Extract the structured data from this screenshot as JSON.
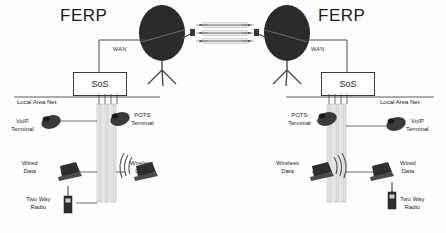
{
  "diagram": {
    "left_site": {
      "site_label": "FERP",
      "node_label": "SoS",
      "wan_label": "WAN",
      "lan_label": "Local Area Net",
      "devices": [
        {
          "name": "VoIP Terminal",
          "line1": "VoIP",
          "line2": "Terminal",
          "icon": "desk-phone-icon"
        },
        {
          "name": "POTS Terminal",
          "line1": "POTS",
          "line2": "Terminal",
          "icon": "desk-phone-icon"
        },
        {
          "name": "Wired Data",
          "line1": "Wired",
          "line2": "Data",
          "icon": "laptop-icon"
        },
        {
          "name": "Wireless Data",
          "line1": "Wireless",
          "line2": "Data",
          "icon": "laptop-wireless-icon"
        },
        {
          "name": "Two Way Radio",
          "line1": "Two Way",
          "line2": "Radio",
          "icon": "handheld-radio-icon"
        }
      ]
    },
    "right_site": {
      "site_label": "FERP",
      "node_label": "SoS",
      "wan_label": "WAN",
      "lan_label": "Local Area Net",
      "devices": [
        {
          "name": "POTS Terminal",
          "line1": "POTS",
          "line2": "Terminal",
          "icon": "desk-phone-icon"
        },
        {
          "name": "VoIP Terminal",
          "line1": "VoIP",
          "line2": "Terminal",
          "icon": "desk-phone-icon"
        },
        {
          "name": "Wireless Data",
          "line1": "Wireless",
          "line2": "Data",
          "icon": "laptop-wireless-icon"
        },
        {
          "name": "Wired Data",
          "line1": "Wired",
          "line2": "Data",
          "icon": "laptop-icon"
        },
        {
          "name": "Two Way Radio",
          "line1": "Two Way",
          "line2": "Radio",
          "icon": "handheld-radio-icon"
        }
      ]
    },
    "satellite_links": {
      "icon": "satellite-dish-icon",
      "channels": [
        {
          "label": ""
        },
        {
          "label": ""
        },
        {
          "label": ""
        }
      ]
    },
    "caption": ""
  },
  "colors": {
    "line": "#4a4a4a",
    "dish_fill": "#2b2b2b",
    "text": "#1a1a1a",
    "background": "#ffffff"
  }
}
